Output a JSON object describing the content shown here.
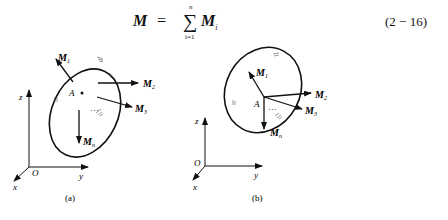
{
  "equation": {
    "lhs": "M",
    "equals": "=",
    "sigma": "∑",
    "upper_limit": "n",
    "lower_limit": "i=1",
    "term": "M",
    "term_subscript": "i",
    "number": "(2 − 16)"
  },
  "figure_a": {
    "caption": "(a)",
    "point": "A",
    "vectors": [
      "M1",
      "M2",
      "M3",
      "Mn"
    ],
    "vector_labels": {
      "m1": "M",
      "m1_sub": "1",
      "m2": "M",
      "m2_sub": "2",
      "m3": "M",
      "m3_sub": "3",
      "mn": "M",
      "mn_sub": "n"
    },
    "dots": "…",
    "axes": {
      "origin": "O",
      "x": "x",
      "y": "y",
      "z": "z"
    }
  },
  "figure_b": {
    "caption": "(b)",
    "point": "A",
    "vector_labels": {
      "m1": "M",
      "m1_sub": "1",
      "m2": "M",
      "m2_sub": "2",
      "m3": "M",
      "m3_sub": "3",
      "mn": "M",
      "mn_sub": "n"
    },
    "dots": "…",
    "axes": {
      "origin": "O",
      "x": "x",
      "y": "y",
      "z": "z"
    }
  }
}
